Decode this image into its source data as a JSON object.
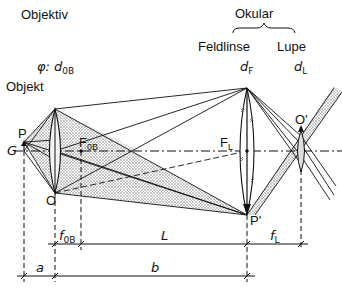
{
  "headers": {
    "objective": "Objektiv",
    "eyepiece": "Okular",
    "field_lens": "Feldlinse",
    "magnifier": "Lupe"
  },
  "symbols": {
    "objective_diameter_prefix": "φ: ",
    "d_ob": "d",
    "d_ob_sub": "0B",
    "d_f": "d",
    "d_f_sub": "F",
    "d_l": "d",
    "d_l_sub": "L"
  },
  "points": {
    "object_label": "Objekt",
    "P": "P",
    "G": "G",
    "O": "O",
    "F_ob": "F",
    "F_ob_sub": "0B",
    "F_L": "F",
    "F_L_sub": "L",
    "P_prime": "P'",
    "O_prime": "O'"
  },
  "dimensions": {
    "f_ob": "f",
    "f_ob_sub": "0B",
    "L": "L",
    "f_L": "f",
    "f_L_sub": "L",
    "a": "a",
    "b": "b"
  },
  "colors": {
    "ink": "#111111",
    "shade": "#9a9a9a",
    "background": "#ffffff"
  }
}
